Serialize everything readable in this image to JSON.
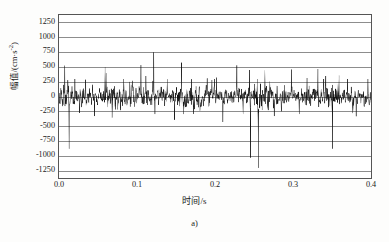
{
  "figure": {
    "caption": "a)",
    "background_color": "#fdfdfc",
    "frame_color": "#555555",
    "grid_color": "#8d8d8d",
    "signal_color": "#111111"
  },
  "chart_data": {
    "type": "line",
    "title": "",
    "subtitle": "",
    "xlabel": "时间/s",
    "ylabel_text": "幅值/(cm·s",
    "ylabel_exponent": "-2",
    "ylabel_tail": ")",
    "ylabel_full": "幅值/(cm·s⁻²)",
    "xlim": [
      0.0,
      0.4
    ],
    "ylim": [
      -1375,
      1375
    ],
    "xticks": [
      0.0,
      0.1,
      0.2,
      0.3,
      0.4
    ],
    "xticklabels": [
      "0.0",
      "0.1",
      "0.2",
      "0.3",
      "0.4"
    ],
    "yticks": [
      1250,
      1000,
      750,
      500,
      250,
      0,
      -250,
      -500,
      -750,
      -1000,
      -1250
    ],
    "yticklabels": [
      "1250",
      "1000",
      "750",
      "500",
      "250",
      "0",
      "-250",
      "-500",
      "-750",
      "-1000",
      "-1250"
    ],
    "grid": true,
    "grid_axis": "y",
    "legend": null,
    "legend_position": "none",
    "series": [
      {
        "name": "加速度时程",
        "sample_rate_hz": 3000,
        "duration_s": 0.4,
        "noise_rms": 105,
        "noise_envelope_peak": 300,
        "seed": 20250413,
        "description": "Dense broadband acceleration noise record with sparse high-amplitude transient spikes.",
        "spikes": [
          {
            "t": 0.0075,
            "value": 520
          },
          {
            "t": 0.013,
            "value": -880
          },
          {
            "t": 0.0205,
            "value": 300
          },
          {
            "t": 0.034,
            "value": 285
          },
          {
            "t": 0.0455,
            "value": -330
          },
          {
            "t": 0.059,
            "value": 500
          },
          {
            "t": 0.0605,
            "value": 395
          },
          {
            "t": 0.068,
            "value": -355
          },
          {
            "t": 0.083,
            "value": 300
          },
          {
            "t": 0.105,
            "value": 530
          },
          {
            "t": 0.1115,
            "value": 350
          },
          {
            "t": 0.1215,
            "value": 745
          },
          {
            "t": 0.123,
            "value": -300
          },
          {
            "t": 0.1385,
            "value": 290
          },
          {
            "t": 0.148,
            "value": -390
          },
          {
            "t": 0.157,
            "value": 570
          },
          {
            "t": 0.16,
            "value": -300
          },
          {
            "t": 0.17,
            "value": 290
          },
          {
            "t": 0.19,
            "value": 305
          },
          {
            "t": 0.202,
            "value": 320
          },
          {
            "t": 0.21,
            "value": -430
          },
          {
            "t": 0.228,
            "value": 525
          },
          {
            "t": 0.236,
            "value": -300
          },
          {
            "t": 0.244,
            "value": 450
          },
          {
            "t": 0.2455,
            "value": -1030
          },
          {
            "t": 0.254,
            "value": 300
          },
          {
            "t": 0.2555,
            "value": -1205
          },
          {
            "t": 0.264,
            "value": 440
          },
          {
            "t": 0.276,
            "value": -330
          },
          {
            "t": 0.298,
            "value": 455
          },
          {
            "t": 0.308,
            "value": -300
          },
          {
            "t": 0.318,
            "value": 315
          },
          {
            "t": 0.332,
            "value": 465
          },
          {
            "t": 0.3395,
            "value": 300
          },
          {
            "t": 0.342,
            "value": 350
          },
          {
            "t": 0.3505,
            "value": -880
          },
          {
            "t": 0.359,
            "value": 355
          },
          {
            "t": 0.37,
            "value": 300
          },
          {
            "t": 0.381,
            "value": -335
          },
          {
            "t": 0.396,
            "value": 300
          }
        ]
      }
    ]
  }
}
